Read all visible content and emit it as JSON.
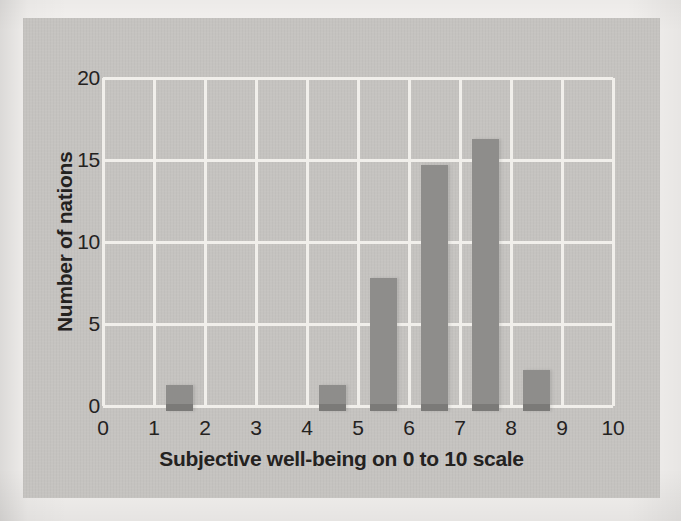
{
  "chart_data": {
    "type": "bar",
    "title": "",
    "xlabel": "Subjective well-being on 0 to 10 scale",
    "ylabel": "Number of nations",
    "xlim": [
      0,
      10
    ],
    "ylim": [
      0,
      20
    ],
    "x_ticks": [
      0,
      1,
      2,
      3,
      4,
      5,
      6,
      7,
      8,
      9,
      10
    ],
    "y_ticks": [
      0,
      5,
      10,
      15,
      20
    ],
    "grid": true,
    "legend_position": "none",
    "bin_centers": [
      1.5,
      4.5,
      5.5,
      6.5,
      7.5,
      8.5
    ],
    "values": [
      1.3,
      1.3,
      7.8,
      14.7,
      16.3,
      2.2
    ],
    "bar_width_units": 0.53,
    "colors": {
      "page_bg": "#f4f2f0",
      "panel_bg": "#c5c3c0",
      "gridline": "#f1efeb",
      "bar": "#8e8d8b",
      "bar_base": "#7b7a78",
      "text": "#24221f"
    }
  }
}
